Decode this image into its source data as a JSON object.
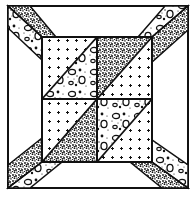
{
  "image": {
    "subject": "quilt-block",
    "style": "black and white line drawing",
    "width": 190,
    "height": 200
  },
  "colors": {
    "background": "#ffffff",
    "ink": "#111111",
    "dots": "#1a1a1a"
  },
  "fabrics": {
    "speckled": "dense black speckle print",
    "cross": "white with small plus/cross dots",
    "blob": "white with outlined pebble shapes and dots",
    "plain": "plain white"
  },
  "layout": {
    "outer": [
      8,
      6,
      188,
      188
    ],
    "center": [
      42,
      37,
      152,
      162
    ]
  }
}
